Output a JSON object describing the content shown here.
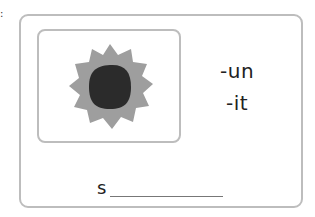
{
  "corner_mark": ":",
  "card": {
    "picture": {
      "icon": "sun-icon",
      "description": "sun with spiky gray rays and dark center",
      "colors": {
        "rays": "#9e9e9e",
        "core": "#2b2b2b",
        "border": "#bdbdbd"
      }
    },
    "options": [
      "-un",
      "-it"
    ],
    "answer": {
      "prefix": "s",
      "value": ""
    }
  }
}
